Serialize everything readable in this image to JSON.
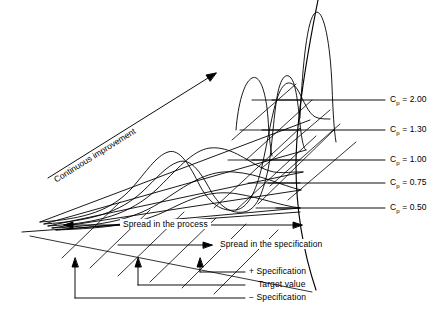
{
  "diagram": {
    "improvement_arrow_label": "Continuous improvement",
    "spread_process_label": "Spread in the process",
    "spread_specification_label": "Spread in the specification",
    "cp_lines": [
      {
        "symbol": "C",
        "subscript": "p",
        "equals": "=",
        "value": "2.00",
        "y": 100,
        "label": "Cp = 2.00"
      },
      {
        "symbol": "C",
        "subscript": "p",
        "equals": "=",
        "value": "1.30",
        "y": 130,
        "label": "Cp = 1.30"
      },
      {
        "symbol": "C",
        "subscript": "p",
        "equals": "=",
        "value": "1.00",
        "y": 160,
        "label": "Cp = 1.00"
      },
      {
        "symbol": "C",
        "subscript": "p",
        "equals": "=",
        "value": "0.75",
        "y": 183,
        "label": "Cp = 0.75"
      },
      {
        "symbol": "C",
        "subscript": "p",
        "equals": "=",
        "value": "0.50",
        "y": 208,
        "label": "Cp = 0.50"
      }
    ],
    "legend": [
      {
        "marker": "+",
        "text": "Specification"
      },
      {
        "marker": "",
        "text": "Target value"
      },
      {
        "marker": "−",
        "text": "Specification"
      }
    ],
    "colors": {
      "ink": "#000000",
      "paper": "#ffffff"
    }
  }
}
